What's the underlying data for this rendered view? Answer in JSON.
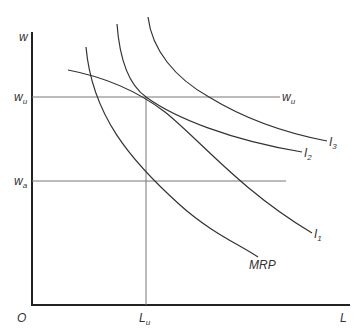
{
  "diagram": {
    "title": "",
    "axes": {
      "y_label": "w",
      "x_label": "L",
      "origin_label": "O"
    },
    "levels": {
      "wu_left": {
        "base": "w",
        "sub": "u"
      },
      "wu_right": {
        "base": "w",
        "sub": "u"
      },
      "wa": {
        "base": "w",
        "sub": "a"
      },
      "lu": {
        "base": "L",
        "sub": "u"
      }
    },
    "curves": {
      "i1": {
        "base": "I",
        "sub": "1"
      },
      "i2": {
        "base": "I",
        "sub": "2"
      },
      "i3": {
        "base": "I",
        "sub": "3"
      },
      "mrp": "MRP"
    },
    "colors": {
      "axis": "#222222",
      "curve": "#333333",
      "guide": "#666666"
    }
  }
}
